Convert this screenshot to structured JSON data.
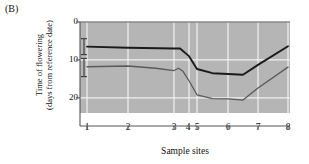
{
  "figure": {
    "panel_label": "(B)",
    "background_color": "#ffffff",
    "plot_background_color": "#b5b5b5",
    "gridline_color": "#f2f2f2",
    "axis_color": "#555555"
  },
  "chart_data": {
    "type": "line",
    "title": "",
    "xlabel": "Sample sites",
    "ylabel": "Time of flowering (days from reference date)",
    "ylabel_line1": "Time of flowering",
    "ylabel_line2": "(days from reference date)",
    "yticks": [
      0,
      10,
      20
    ],
    "ytick_labels": [
      "0",
      "10",
      "20"
    ],
    "ylim": [
      0,
      24
    ],
    "y_inverted": true,
    "xticks": [
      1,
      2,
      3,
      4,
      5,
      6,
      7,
      8
    ],
    "xtick_labels": [
      "1",
      "2",
      "3",
      "4",
      "5",
      "6",
      "7",
      "8"
    ],
    "xtick_positions_px": [
      87,
      128,
      174,
      189,
      197,
      228,
      258,
      288
    ],
    "xlim": [
      1,
      8
    ],
    "grid": true,
    "legend_position": "inline-annotations",
    "series": [
      {
        "name": "Stigma emergence",
        "label": "Stigma emergence",
        "color": "#1a1a1a",
        "x": [
          1,
          2,
          3,
          3.4,
          4,
          5,
          5.5,
          6,
          6.5,
          7,
          8
        ],
        "values": [
          6.5,
          6.8,
          7.0,
          7.0,
          9.0,
          12.4,
          13.5,
          13.7,
          13.9,
          11.3,
          6.4
        ]
      },
      {
        "name": "Anther emergence",
        "label": "Anther emergence",
        "color": "#5a5a5a",
        "x": [
          1,
          2,
          2.6,
          3,
          3.3,
          3.6,
          4,
          5,
          5.5,
          6,
          6.5,
          7,
          8
        ],
        "values": [
          11.8,
          11.6,
          12.2,
          12.8,
          12.2,
          13.0,
          15.5,
          19.2,
          20.2,
          20.3,
          20.6,
          17.4,
          11.9
        ]
      }
    ],
    "error_bars": [
      {
        "for_series": "Stigma emergence",
        "x_px": 84,
        "center": 6.5,
        "half_range": 2.1
      },
      {
        "for_series": "Anther emergence",
        "x_px": 84,
        "center": 12.0,
        "half_range": 2.4
      }
    ],
    "annotations": [
      {
        "text": "Stigma emergence",
        "x_px": 97,
        "y_px": 34
      },
      {
        "text": "Anther emergence",
        "x_px": 97,
        "y_px": 80
      }
    ]
  }
}
